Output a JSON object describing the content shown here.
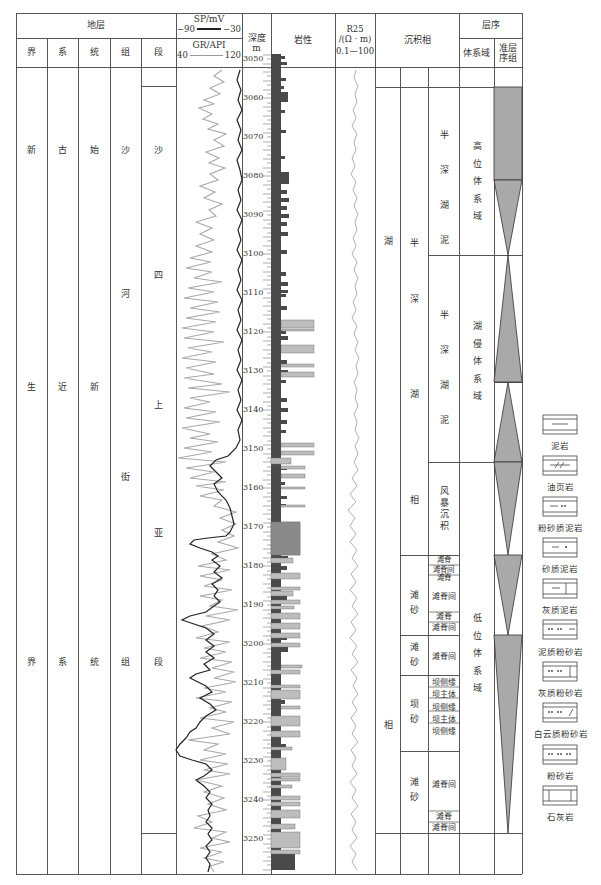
{
  "header": {
    "stratum_group": "地层",
    "stratum_cols": [
      "界",
      "系",
      "统",
      "组",
      "段"
    ],
    "sp_label": "SP/mV",
    "sp_min": "−90",
    "sp_max": "−30",
    "gr_label": "GR/API",
    "gr_min": "40",
    "gr_max": "120",
    "depth_label_1": "深度",
    "depth_label_2": "m",
    "lithology": "岩性",
    "r25_label": "R25",
    "r25_unit": "/(Ω · m)",
    "r25_range": "0.1—100",
    "facies": "沉积相",
    "sequence": "层序",
    "systems_tract": "体系域",
    "parasequence_set": "准层序组"
  },
  "columns": {
    "jie": {
      "top": "新",
      "mid": "生",
      "bottom": "界"
    },
    "xi": {
      "top": "古",
      "mid": "近",
      "bottom": "系"
    },
    "tong": {
      "top": "始",
      "mid": "新",
      "bottom": "统"
    },
    "zu": {
      "chars": [
        "沙",
        "河",
        "街",
        "组"
      ]
    },
    "duan": {
      "chars": [
        "沙",
        "四",
        "上",
        "亚",
        "段"
      ]
    }
  },
  "depth_ticks": [
    "3050",
    "3060",
    "3070",
    "3080",
    "3090",
    "3100",
    "3110",
    "3120",
    "3130",
    "3140",
    "3150",
    "3160",
    "3170",
    "3180",
    "3190",
    "3200",
    "3210",
    "3220",
    "3230",
    "3240",
    "3250"
  ],
  "facies": {
    "col1": [
      "湖",
      "相"
    ],
    "col2_upper": [
      "半",
      "深",
      "湖",
      "相"
    ],
    "col2_items": [
      {
        "chars": [
          "滩",
          "砂"
        ]
      },
      {
        "chars": [
          "滩",
          "砂"
        ]
      },
      {
        "chars": [
          "坝",
          "砂"
        ]
      },
      {
        "chars": [
          "滩",
          "砂"
        ]
      }
    ],
    "col3_items": [
      {
        "chars": [
          "半",
          "深",
          "湖",
          "泥"
        ]
      },
      {
        "chars": [
          "半",
          "深",
          "湖",
          "泥"
        ]
      },
      {
        "chars": [
          "风",
          "暴",
          "沉",
          "积"
        ]
      }
    ],
    "microfacies": {
      "g1": [
        "滩脊",
        "滩脊间",
        "滩脊"
      ],
      "g1b": "滩脊间",
      "g1c": [
        "滩脊",
        "滩脊间"
      ],
      "g2": "滩脊间",
      "g3": [
        "坝侧缘",
        "坝主体",
        "坝侧缘",
        "坝主体",
        "坝侧缘"
      ],
      "g4": "滩脊间",
      "g4b": [
        "滩脊",
        "滩脊间"
      ]
    }
  },
  "systems_tracts": [
    {
      "chars": [
        "高",
        "位",
        "体",
        "系",
        "域"
      ]
    },
    {
      "chars": [
        "湖",
        "侵",
        "体",
        "系",
        "域"
      ]
    },
    {
      "chars": [
        "低",
        "位",
        "体",
        "系",
        "域"
      ]
    }
  ],
  "legend": [
    {
      "label": "泥岩",
      "pattern": "mudstone"
    },
    {
      "label": "油页岩",
      "pattern": "oil-shale"
    },
    {
      "label": "粉砂质泥岩",
      "pattern": "silty-mudstone"
    },
    {
      "label": "砂质泥岩",
      "pattern": "sandy-mudstone"
    },
    {
      "label": "灰质泥岩",
      "pattern": "calcareous-mudstone"
    },
    {
      "label": "泥质粉砂岩",
      "pattern": "argillaceous-siltstone"
    },
    {
      "label": "灰质粉砂岩",
      "pattern": "calcareous-siltstone"
    },
    {
      "label": "白云质粉砂岩",
      "pattern": "dolomitic-siltstone"
    },
    {
      "label": "粉砂岩",
      "pattern": "siltstone"
    },
    {
      "label": "石灰岩",
      "pattern": "limestone"
    }
  ],
  "colors": {
    "line": "#555555",
    "gr_curve": "#a8a8a8",
    "sp_curve": "#222222",
    "r25_curve": "#b0b0b0",
    "mudstone_fill": "#555555",
    "silt_fill": "#bdbdbd",
    "triangle_fill": "#a9a9a9"
  }
}
